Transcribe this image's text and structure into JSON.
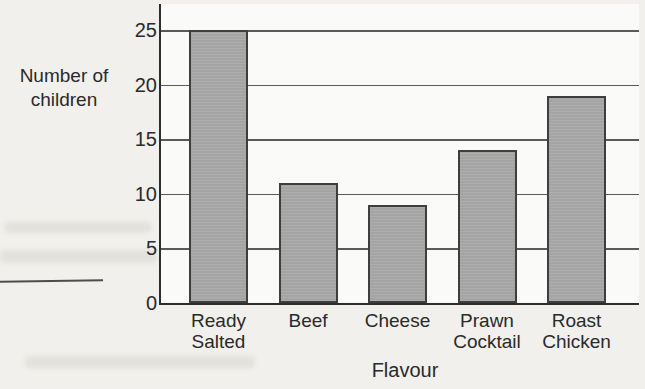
{
  "page": {
    "kind": "scanned worksheet page with bar chart",
    "colors": {
      "page_bg": "#f1f0ec",
      "plot_bg": "#fafaf8",
      "grid_line": "#5a5a5a",
      "axis_line": "#2d2d2d",
      "text": "#2a2a2a",
      "answer_rule": "#4d4d4d",
      "bar_fill": "#a9a9a9",
      "bar_border": "#3e3e3e"
    }
  },
  "chart_data": {
    "type": "bar",
    "title": "",
    "categories": [
      "Ready Salted",
      "Beef",
      "Cheese",
      "Prawn Cocktail",
      "Roast Chicken"
    ],
    "category_label_lines": [
      [
        "Ready",
        "Salted"
      ],
      [
        "Beef"
      ],
      [
        "Cheese"
      ],
      [
        "Prawn",
        "Cocktail"
      ],
      [
        "Roast",
        "Chicken"
      ]
    ],
    "values": [
      25,
      11,
      9,
      14,
      19
    ],
    "xlabel": "Flavour",
    "ylabel": "Number of children",
    "ylabel_lines": [
      "Number of",
      "children"
    ],
    "yticks": [
      0,
      5,
      10,
      15,
      20,
      25
    ],
    "ylim": [
      0,
      27.4
    ],
    "grid": "horizontal",
    "legend": "none"
  }
}
